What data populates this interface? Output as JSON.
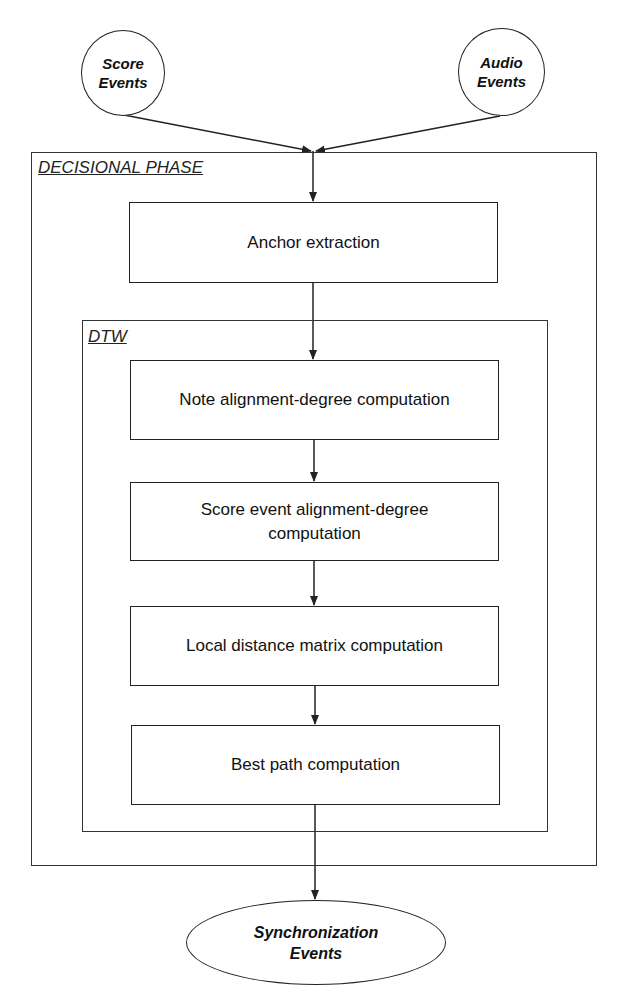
{
  "diagram": {
    "inputs": [
      {
        "id": "score_events",
        "label": "Score\nEvents",
        "line1": "Score",
        "line2": "Events",
        "shape": "circle"
      },
      {
        "id": "audio_events",
        "label": "Audio\nEvents",
        "line1": "Audio",
        "line2": "Events",
        "shape": "circle"
      }
    ],
    "containers": {
      "outer": {
        "label": "DECISIONAL PHASE"
      },
      "inner": {
        "label": "DTW"
      }
    },
    "steps": [
      {
        "id": "anchor",
        "label": "Anchor extraction"
      },
      {
        "id": "note",
        "label": "Note alignment-degree computation"
      },
      {
        "id": "score_event",
        "line1": "Score event alignment-degree",
        "line2": "computation"
      },
      {
        "id": "local",
        "label": "Local distance matrix computation"
      },
      {
        "id": "best_path",
        "label": "Best path computation"
      }
    ],
    "output": {
      "id": "sync_events",
      "line1": "Synchronization",
      "line2": "Events",
      "shape": "ellipse"
    },
    "edges": [
      [
        "score_events",
        "anchor"
      ],
      [
        "audio_events",
        "anchor"
      ],
      [
        "anchor",
        "note"
      ],
      [
        "note",
        "score_event"
      ],
      [
        "score_event",
        "local"
      ],
      [
        "local",
        "best_path"
      ],
      [
        "best_path",
        "sync_events"
      ]
    ],
    "colors": {
      "stroke": "#222222",
      "background": "#ffffff",
      "text": "#111111"
    }
  }
}
